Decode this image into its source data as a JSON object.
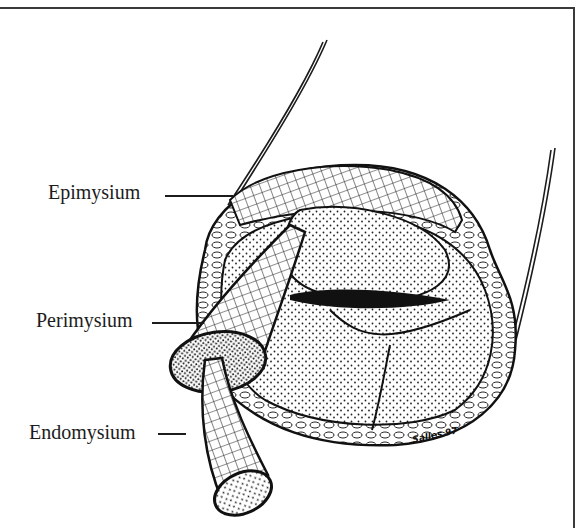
{
  "figure": {
    "labels": [
      {
        "id": "epimysium",
        "text": "Epimysium"
      },
      {
        "id": "perimysium",
        "text": "Perimysium"
      },
      {
        "id": "endomysium",
        "text": "Endomysium"
      }
    ],
    "signature": "Salles 97"
  },
  "colors": {
    "ink": "#1c1c1c",
    "paper": "#ffffff",
    "frame": "#3a3a3a"
  }
}
